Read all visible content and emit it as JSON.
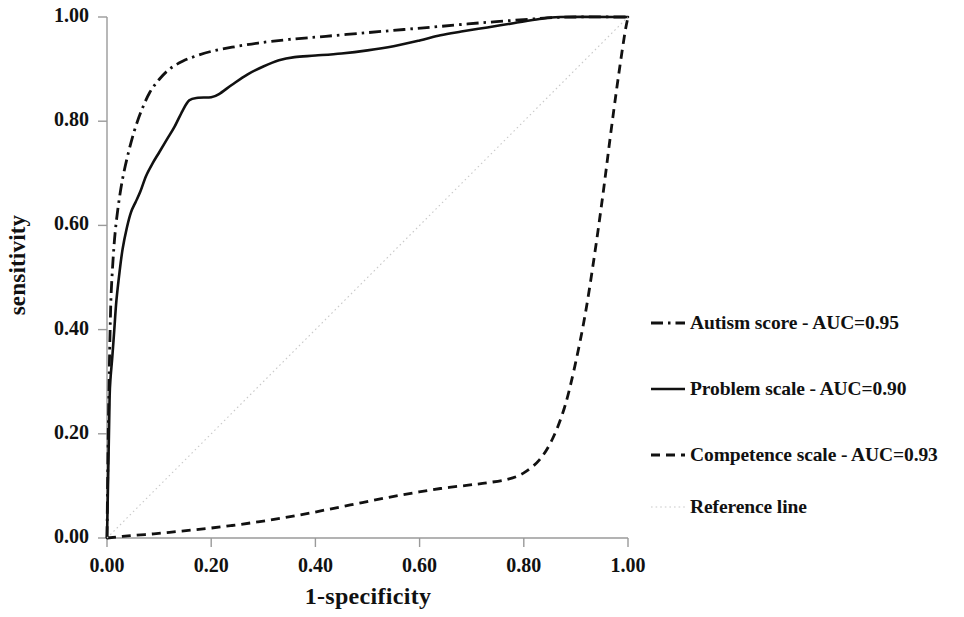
{
  "chart_data": {
    "type": "line",
    "title": "",
    "xlabel": "1-specificity",
    "ylabel": "sensitivity",
    "xlim": [
      0,
      1
    ],
    "ylim": [
      0,
      1
    ],
    "grid": false,
    "legend_position": "right",
    "x_ticks": [
      "0.00",
      "0.20",
      "0.40",
      "0.60",
      "0.80",
      "1.00"
    ],
    "y_ticks": [
      "0.00",
      "0.20",
      "0.40",
      "0.60",
      "0.80",
      "1.00"
    ],
    "x_tick_values": [
      0,
      0.2,
      0.4,
      0.6,
      0.8,
      1
    ],
    "y_tick_values": [
      0,
      0.2,
      0.4,
      0.6,
      0.8,
      1
    ],
    "series": [
      {
        "name": "Autism score - AUC=0.95",
        "label_short": "Autism score",
        "auc": 0.95,
        "style": "dash-dot",
        "color": "#111111",
        "points": [
          [
            0.0,
            0.0
          ],
          [
            0.002,
            0.17
          ],
          [
            0.004,
            0.3
          ],
          [
            0.006,
            0.4
          ],
          [
            0.008,
            0.47
          ],
          [
            0.012,
            0.54
          ],
          [
            0.016,
            0.59
          ],
          [
            0.022,
            0.64
          ],
          [
            0.03,
            0.69
          ],
          [
            0.04,
            0.735
          ],
          [
            0.052,
            0.78
          ],
          [
            0.066,
            0.82
          ],
          [
            0.082,
            0.855
          ],
          [
            0.1,
            0.88
          ],
          [
            0.12,
            0.9
          ],
          [
            0.145,
            0.915
          ],
          [
            0.17,
            0.925
          ],
          [
            0.2,
            0.934
          ],
          [
            0.24,
            0.942
          ],
          [
            0.29,
            0.95
          ],
          [
            0.35,
            0.957
          ],
          [
            0.42,
            0.963
          ],
          [
            0.5,
            0.97
          ],
          [
            0.57,
            0.976
          ],
          [
            0.64,
            0.982
          ],
          [
            0.72,
            0.989
          ],
          [
            0.8,
            0.995
          ],
          [
            0.86,
            0.999
          ],
          [
            0.9,
            1.0
          ],
          [
            1.0,
            1.0
          ]
        ]
      },
      {
        "name": "Problem scale - AUC=0.90",
        "label_short": "Problem scale",
        "auc": 0.9,
        "style": "solid",
        "color": "#111111",
        "points": [
          [
            0.0,
            0.0
          ],
          [
            0.003,
            0.16
          ],
          [
            0.005,
            0.27
          ],
          [
            0.007,
            0.31
          ],
          [
            0.01,
            0.345
          ],
          [
            0.014,
            0.4
          ],
          [
            0.018,
            0.455
          ],
          [
            0.024,
            0.51
          ],
          [
            0.03,
            0.555
          ],
          [
            0.038,
            0.595
          ],
          [
            0.046,
            0.625
          ],
          [
            0.055,
            0.645
          ],
          [
            0.064,
            0.665
          ],
          [
            0.075,
            0.695
          ],
          [
            0.088,
            0.72
          ],
          [
            0.1,
            0.74
          ],
          [
            0.115,
            0.765
          ],
          [
            0.13,
            0.79
          ],
          [
            0.145,
            0.82
          ],
          [
            0.158,
            0.84
          ],
          [
            0.175,
            0.845
          ],
          [
            0.2,
            0.846
          ],
          [
            0.215,
            0.852
          ],
          [
            0.24,
            0.87
          ],
          [
            0.27,
            0.89
          ],
          [
            0.3,
            0.905
          ],
          [
            0.33,
            0.917
          ],
          [
            0.36,
            0.923
          ],
          [
            0.4,
            0.926
          ],
          [
            0.45,
            0.93
          ],
          [
            0.5,
            0.936
          ],
          [
            0.55,
            0.944
          ],
          [
            0.6,
            0.955
          ],
          [
            0.64,
            0.965
          ],
          [
            0.68,
            0.972
          ],
          [
            0.73,
            0.98
          ],
          [
            0.78,
            0.988
          ],
          [
            0.83,
            0.996
          ],
          [
            0.87,
            1.0
          ],
          [
            1.0,
            1.0
          ]
        ]
      },
      {
        "name": "Competence scale - AUC=0.93",
        "label_short": "Competence scale",
        "auc": 0.93,
        "style": "dashed",
        "color": "#111111",
        "points": [
          [
            0.0,
            0.0
          ],
          [
            0.04,
            0.004
          ],
          [
            0.09,
            0.008
          ],
          [
            0.14,
            0.013
          ],
          [
            0.19,
            0.018
          ],
          [
            0.24,
            0.024
          ],
          [
            0.29,
            0.031
          ],
          [
            0.34,
            0.039
          ],
          [
            0.39,
            0.048
          ],
          [
            0.44,
            0.058
          ],
          [
            0.49,
            0.068
          ],
          [
            0.54,
            0.078
          ],
          [
            0.59,
            0.087
          ],
          [
            0.64,
            0.095
          ],
          [
            0.69,
            0.101
          ],
          [
            0.73,
            0.106
          ],
          [
            0.77,
            0.113
          ],
          [
            0.8,
            0.125
          ],
          [
            0.83,
            0.15
          ],
          [
            0.855,
            0.19
          ],
          [
            0.878,
            0.25
          ],
          [
            0.898,
            0.33
          ],
          [
            0.918,
            0.43
          ],
          [
            0.936,
            0.545
          ],
          [
            0.952,
            0.66
          ],
          [
            0.966,
            0.77
          ],
          [
            0.978,
            0.86
          ],
          [
            0.988,
            0.93
          ],
          [
            0.995,
            0.975
          ],
          [
            1.0,
            1.0
          ]
        ]
      },
      {
        "name": "Reference line",
        "label_short": "Reference line",
        "auc": null,
        "style": "dotted",
        "color": "#c9c9c9",
        "points": [
          [
            0.0,
            0.0
          ],
          [
            1.0,
            1.0
          ]
        ]
      }
    ]
  },
  "axes": {
    "y_title": "sensitivity",
    "x_title": "1-specificity"
  },
  "legend": {
    "items": [
      {
        "sample": "dash-dot",
        "label": "Autism score - AUC=0.95"
      },
      {
        "sample": "solid",
        "label": "Problem scale - AUC=0.90"
      },
      {
        "sample": "dashed",
        "label": "Competence scale - AUC=0.93"
      },
      {
        "sample": "dotted",
        "label": "Reference line"
      }
    ]
  },
  "colors": {
    "curve": "#111111",
    "reference": "#c9c9c9",
    "axis": "#9a9a9a",
    "background": "#ffffff"
  }
}
